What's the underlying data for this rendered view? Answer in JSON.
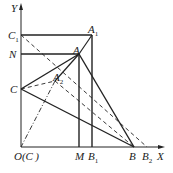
{
  "diagram": {
    "points": {
      "O": {
        "label": "O(C )",
        "x": 21,
        "y": 147
      },
      "Y": {
        "label": "Y",
        "x": 21,
        "y": 5
      },
      "X": {
        "label": "X",
        "x": 163,
        "y": 147
      },
      "C1": {
        "label": "C",
        "sub": "1",
        "x": 21,
        "y": 35
      },
      "N": {
        "label": "N",
        "x": 21,
        "y": 54
      },
      "C": {
        "label": "C",
        "x": 21,
        "y": 89
      },
      "A1": {
        "label": "A",
        "sub": "1",
        "x": 92,
        "y": 35
      },
      "A": {
        "label": "A",
        "x": 79,
        "y": 54
      },
      "A2": {
        "label": "A",
        "sub": "2",
        "x": 55,
        "y": 81
      },
      "M": {
        "label": "M",
        "x": 81,
        "y": 147
      },
      "B1": {
        "label": "B",
        "sub": "1",
        "x": 92,
        "y": 147
      },
      "B": {
        "label": "B",
        "x": 134,
        "y": 147
      },
      "B2": {
        "label": "B",
        "sub": "2",
        "x": 147,
        "y": 147
      }
    }
  }
}
